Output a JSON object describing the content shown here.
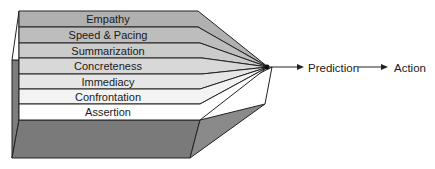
{
  "diagram": {
    "layers": [
      {
        "label": "Empathy",
        "fill": "#b0b0b0"
      },
      {
        "label": "Speed & Pacing",
        "fill": "#bdbdbd"
      },
      {
        "label": "Summarization",
        "fill": "#cbcbcb"
      },
      {
        "label": "Concreteness",
        "fill": "#d8d8d8"
      },
      {
        "label": "Immediacy",
        "fill": "#e6e6e6"
      },
      {
        "label": "Confrontation",
        "fill": "#f3f3f3"
      },
      {
        "label": "Assertion",
        "fill": "#ffffff"
      }
    ],
    "flow": {
      "step1": "Prediction",
      "step2": "Action"
    },
    "colors": {
      "base": "#7a7a7a",
      "side": "#8a8a8a",
      "stroke": "#222222"
    }
  }
}
